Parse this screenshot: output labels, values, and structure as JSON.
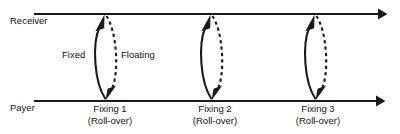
{
  "diagram": {
    "background_color": "#ffffff",
    "line_color": "#1a1a1a",
    "text_color": "#141414",
    "axes": [
      {
        "name": "receiver-axis",
        "label": "Receiver",
        "label_x": 10,
        "label_y": 24,
        "y": 14,
        "x_start": 34,
        "x_end": 386,
        "arrow": "right"
      },
      {
        "name": "payer-axis",
        "label": "Payer",
        "label_x": 10,
        "label_y": 111,
        "y": 101,
        "x_start": 34,
        "x_end": 384,
        "arrow": "right"
      }
    ],
    "flow_labels": [
      {
        "name": "fixed-leg-label",
        "text": "Fixed",
        "x": 62,
        "y": 58,
        "leg": "fixed",
        "style": "solid"
      },
      {
        "name": "floating-leg-label",
        "text": "Floating",
        "x": 121,
        "y": 58,
        "leg": "floating",
        "style": "dashed"
      }
    ],
    "fixings": [
      {
        "name": "fixing-1",
        "label_line1": "Fixing 1",
        "label_line2": "(Roll-over)",
        "center_x": 110,
        "node_x": 105,
        "label_y1": 112,
        "label_y2": 124
      },
      {
        "name": "fixing-2",
        "label_line1": "Fixing 2",
        "label_line2": "(Roll-over)",
        "center_x": 215,
        "node_x": 211,
        "label_y1": 112,
        "label_y2": 124
      },
      {
        "name": "fixing-3",
        "label_line1": "Fixing 3",
        "label_line2": "(Roll-over)",
        "center_x": 318,
        "node_x": 315,
        "label_y1": 112,
        "label_y2": 124
      }
    ],
    "legs": {
      "fixed": {
        "direction": "up",
        "style": "solid",
        "description": "solid curved arrow from Payer axis up to Receiver axis"
      },
      "floating": {
        "direction": "down",
        "style": "dashed",
        "description": "dashed curved arrow from Receiver axis down to Payer axis"
      }
    }
  }
}
